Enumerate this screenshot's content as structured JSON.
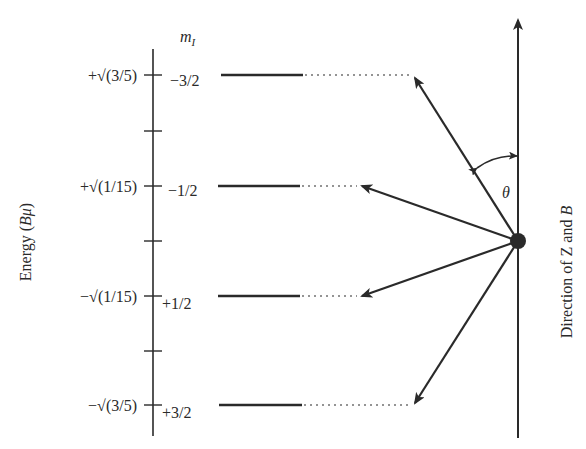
{
  "diagram": {
    "type": "nuclear-spin-energy-level-diagram",
    "axis_label": "Energy (Bμ)",
    "axis_label_parts": {
      "prefix": "Energy (",
      "symbol": "Bμ",
      "suffix": ")"
    },
    "column_header": {
      "symbol": "m",
      "subscript": "I"
    },
    "direction_label": {
      "prefix": "Direction of ",
      "z": "Z",
      "and": " and ",
      "b": "B"
    },
    "angle_label": "θ",
    "levels": [
      {
        "energy": "+√(3/5)",
        "m_I": "−3/2",
        "y": 75,
        "arrow_tip": [
          410,
          75
        ]
      },
      {
        "energy": "+√(1/15)",
        "m_I": "−1/2",
        "y": 186,
        "arrow_tip": [
          360,
          186
        ]
      },
      {
        "energy": "−√(1/15)",
        "m_I": "+1/2",
        "y": 296,
        "arrow_tip": [
          360,
          296
        ]
      },
      {
        "energy": "−√(3/5)",
        "m_I": "+3/2",
        "y": 405,
        "arrow_tip": [
          412,
          405
        ]
      }
    ],
    "colors": {
      "ink": "#2a2a2a",
      "background": "#ffffff"
    }
  }
}
